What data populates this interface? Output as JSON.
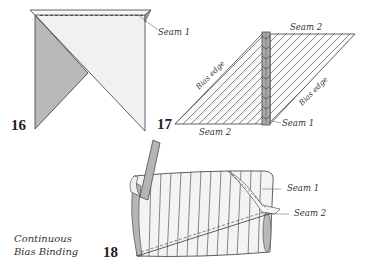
{
  "figures": {
    "fig16": {
      "number": "16",
      "seam_label": "Seam 1"
    },
    "fig17": {
      "number": "17",
      "seam2_top": "Seam 2",
      "seam2_bottom": "Seam 2",
      "seam1": "Seam 1",
      "bias_edge_left": "Bias edge",
      "bias_edge_right": "Bias edge"
    },
    "fig18": {
      "number": "18",
      "seam1": "Seam 1",
      "seam2": "Seam 2"
    }
  },
  "caption": {
    "line1": "Continuous",
    "line2": "Bias Binding"
  },
  "colors": {
    "outline": "#3a3a3a",
    "fabric_light": "#f1f1f1",
    "fabric_grey": "#b9b9b9",
    "strip_grey": "#a9a9a9",
    "background": "#ffffff"
  }
}
